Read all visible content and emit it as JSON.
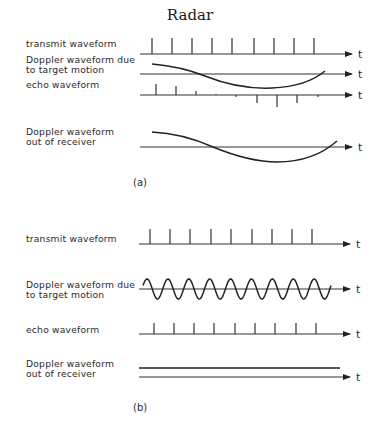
{
  "title": "Radar",
  "axis_label": "t",
  "arrow_color": "#222222",
  "panels": [
    {
      "caption": "(a)",
      "rows": [
        {
          "id": "transmit",
          "label_lines": [
            "transmit waveform"
          ],
          "label_y": [
            47
          ],
          "baseline_y": 54,
          "axis_x": [
            140,
            352
          ],
          "kind": "pulses",
          "pulses": [
            {
              "x": 152,
              "h": 16
            },
            {
              "x": 172,
              "h": 16
            },
            {
              "x": 192,
              "h": 16
            },
            {
              "x": 212,
              "h": 16
            },
            {
              "x": 232,
              "h": 16
            },
            {
              "x": 254,
              "h": 16
            },
            {
              "x": 274,
              "h": 16
            },
            {
              "x": 294,
              "h": 16
            },
            {
              "x": 314,
              "h": 16
            }
          ]
        },
        {
          "id": "doppler-target",
          "label_lines": [
            "Doppler waveform due",
            "to target motion"
          ],
          "label_y": [
            63,
            73
          ],
          "baseline_y": 74,
          "axis_x": [
            140,
            352
          ],
          "kind": "curve",
          "path": "M152,64 C175,66 190,70 205,76 C225,84 250,89 272,88 C295,87 312,82 325,71"
        },
        {
          "id": "echo",
          "label_lines": [
            "echo waveform"
          ],
          "label_y": [
            88
          ],
          "baseline_y": 95,
          "axis_x": [
            140,
            352
          ],
          "kind": "pulses",
          "pulses": [
            {
              "x": 156,
              "h": 11
            },
            {
              "x": 176,
              "h": 9
            },
            {
              "x": 196,
              "h": 4
            },
            {
              "x": 216,
              "h": 1
            },
            {
              "x": 236,
              "h": -2
            },
            {
              "x": 257,
              "h": -8
            },
            {
              "x": 277,
              "h": -12
            },
            {
              "x": 297,
              "h": -8
            },
            {
              "x": 318,
              "h": -2
            }
          ]
        },
        {
          "id": "doppler-receiver",
          "label_lines": [
            "Doppler waveform",
            "out of receiver"
          ],
          "label_y": [
            135,
            145
          ],
          "baseline_y": 147,
          "axis_x": [
            140,
            352
          ],
          "kind": "curve",
          "path": "M152,132 C175,133 195,139 213,147 C235,156 255,162 277,162 C300,162 320,156 337,141"
        }
      ],
      "caption_pos": {
        "x": 133,
        "y": 186
      }
    },
    {
      "caption": "(b)",
      "rows": [
        {
          "id": "transmit",
          "label_lines": [
            "transmit waveform"
          ],
          "label_y": [
            242
          ],
          "baseline_y": 244,
          "axis_x": [
            139,
            350
          ],
          "kind": "pulses",
          "pulses": [
            {
              "x": 150,
              "h": 15
            },
            {
              "x": 170,
              "h": 15
            },
            {
              "x": 190,
              "h": 15
            },
            {
              "x": 211,
              "h": 15
            },
            {
              "x": 231,
              "h": 15
            },
            {
              "x": 252,
              "h": 15
            },
            {
              "x": 272,
              "h": 15
            },
            {
              "x": 292,
              "h": 15
            },
            {
              "x": 312,
              "h": 15
            }
          ]
        },
        {
          "id": "doppler-target",
          "label_lines": [
            "Doppler waveform due",
            "to target motion"
          ],
          "label_y": [
            288,
            298
          ],
          "baseline_y": 289,
          "axis_x": [
            139,
            350
          ],
          "kind": "sine",
          "sine": {
            "x0": 143,
            "x1": 331,
            "amplitude": 10,
            "cycles": 9,
            "phase_deg": 200
          }
        },
        {
          "id": "echo",
          "label_lines": [
            "echo waveform"
          ],
          "label_y": [
            333
          ],
          "baseline_y": 334,
          "axis_x": [
            139,
            350
          ],
          "kind": "pulses",
          "pulses": [
            {
              "x": 154,
              "h": 11
            },
            {
              "x": 174,
              "h": 11
            },
            {
              "x": 194,
              "h": 11
            },
            {
              "x": 214,
              "h": 11
            },
            {
              "x": 235,
              "h": 11
            },
            {
              "x": 255,
              "h": 11
            },
            {
              "x": 275,
              "h": 11
            },
            {
              "x": 296,
              "h": 11
            },
            {
              "x": 316,
              "h": 11
            }
          ]
        },
        {
          "id": "doppler-receiver",
          "label_lines": [
            "Doppler waveform",
            "out of receiver"
          ],
          "label_y": [
            367,
            377
          ],
          "baseline_y": 377,
          "axis_x": [
            139,
            350
          ],
          "kind": "flat",
          "flat": {
            "x0": 139,
            "x1": 340,
            "y": 368
          }
        }
      ],
      "caption_pos": {
        "x": 133,
        "y": 411
      }
    }
  ]
}
